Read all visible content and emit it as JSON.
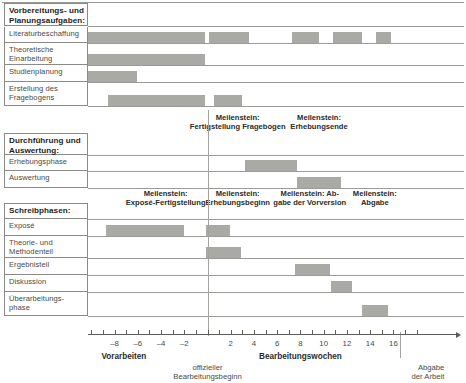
{
  "chart_data": {
    "type": "bar",
    "chart_kind": "gantt",
    "title": "",
    "xlabel": "Bearbeitungswochen",
    "ylabel": "",
    "xlim": [
      -13.5,
      18.5
    ],
    "grid": true,
    "axis": {
      "tick_step": 1,
      "labeled_ticks": [
        -8,
        -6,
        -4,
        -2,
        2,
        4,
        6,
        8,
        10,
        12,
        14,
        16
      ],
      "tick_labels": [
        "–8",
        "–6",
        "–4",
        "–2",
        "2",
        "4",
        "6",
        "8",
        "10",
        "12",
        "14",
        "16"
      ],
      "zero_line_week": 0,
      "end_line_week": 16.6,
      "left_caption": "Vorarbeiten",
      "right_caption": "Bearbeitungswochen",
      "zero_note": [
        "offizieller",
        "Bearbeitungsbeginn"
      ],
      "end_note": [
        "Abgabe",
        "der Arbeit"
      ]
    },
    "colors": {
      "bar": "#a9a9a5",
      "rule": "#8a8a86",
      "text": "#4a4a46",
      "heading_text": "#1e1e1c",
      "background": "#ffffff"
    },
    "sections": [
      {
        "id": "vorbereitung",
        "heading": "Vorbereitungs- und Planungsaufgaben:",
        "heading_lines": [
          "Vorbereitungs- und",
          "Planungsaufgaben:"
        ],
        "milestones": [],
        "tasks": [
          {
            "label": "Literaturbeschaffung",
            "label_lines": [
              "Literaturbeschaffung"
            ],
            "bars": [
              {
                "start": -13.0,
                "end": -0.2
              },
              {
                "start": 0.1,
                "end": 3.6
              },
              {
                "start": 7.3,
                "end": 9.6
              },
              {
                "start": 10.8,
                "end": 13.3
              },
              {
                "start": 14.5,
                "end": 15.8
              }
            ]
          },
          {
            "label": "Theoretische Einarbeitung",
            "label_lines": [
              "Theoretische",
              "Einarbeitung"
            ],
            "bars": [
              {
                "start": -13.0,
                "end": -6.0
              },
              {
                "start": -6.0,
                "end": -0.2
              }
            ]
          },
          {
            "label": "Studienplanung",
            "label_lines": [
              "Studienplanung"
            ],
            "bars": [
              {
                "start": -13.0,
                "end": -6.1
              }
            ]
          },
          {
            "label": "Erstellung des Fragebogens",
            "label_lines": [
              "Erstellung des",
              "Fragebogens"
            ],
            "bars": [
              {
                "start": -8.6,
                "end": -0.2
              },
              {
                "start": 0.6,
                "end": 3.0
              }
            ]
          }
        ]
      },
      {
        "id": "durchfuehrung",
        "heading": "Durchführung und Auswertung:",
        "heading_lines": [
          "Durchführung und",
          "Auswertung:"
        ],
        "milestones": [
          {
            "lines": [
              "Meilenstein:",
              "Fertigstellung Fragebogen"
            ],
            "week": 2.6
          },
          {
            "lines": [
              "Meilenstein:",
              "Erhebungsende"
            ],
            "week": 9.6
          }
        ],
        "tasks": [
          {
            "label": "Erhebungsphase",
            "label_lines": [
              "Erhebungsphase"
            ],
            "bars": [
              {
                "start": 3.2,
                "end": 7.7
              }
            ]
          },
          {
            "label": "Auswertung",
            "label_lines": [
              "Auswertung"
            ],
            "bars": [
              {
                "start": 7.7,
                "end": 11.5
              }
            ]
          }
        ]
      },
      {
        "id": "schreibphasen",
        "heading": "Schreibphasen:",
        "heading_lines": [
          "Schreibphasen:"
        ],
        "milestones": [
          {
            "lines": [
              "Meilenstein:",
              "Exposé-Fertigstellung"
            ],
            "week": -3.6
          },
          {
            "lines": [
              "Meilenstein:",
              "Erhebungsbeginn"
            ],
            "week": 2.6
          },
          {
            "lines": [
              "Meilenstein: Ab-",
              "gabe der Vorversion"
            ],
            "week": 8.8
          },
          {
            "lines": [
              "Meilenstein:",
              "Abgabe"
            ],
            "week": 14.4
          }
        ],
        "tasks": [
          {
            "label": "Exposé",
            "label_lines": [
              "Exposé"
            ],
            "bars": [
              {
                "start": -8.7,
                "end": -2.0
              },
              {
                "start": -0.1,
                "end": 1.9
              }
            ]
          },
          {
            "label": "Theorie- und Methodenteil",
            "label_lines": [
              "Theorie- und",
              "Methodenteil"
            ],
            "bars": [
              {
                "start": -0.1,
                "end": 2.9
              }
            ]
          },
          {
            "label": "Ergebnisteil",
            "label_lines": [
              "Ergebnisteil"
            ],
            "bars": [
              {
                "start": 7.5,
                "end": 10.5
              }
            ]
          },
          {
            "label": "Diskussion",
            "label_lines": [
              "Diskussion"
            ],
            "bars": [
              {
                "start": 10.6,
                "end": 12.4
              }
            ]
          },
          {
            "label": "Überarbeitungsphase",
            "label_lines": [
              "Überarbeitungs-",
              "phase"
            ],
            "bars": [
              {
                "start": 13.3,
                "end": 15.5
              }
            ]
          }
        ]
      }
    ]
  }
}
